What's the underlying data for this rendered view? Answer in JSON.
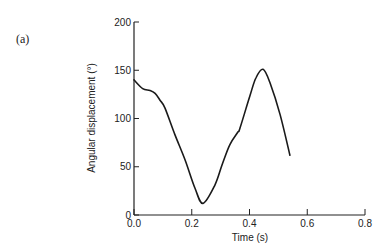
{
  "panel_label": "(a)",
  "chart_data": {
    "type": "line",
    "title": "",
    "xlabel": "Time (s)",
    "ylabel": "Angular displacement (°)",
    "xlim": [
      0.0,
      0.8
    ],
    "ylim": [
      0,
      200
    ],
    "x_ticks": [
      "0.0",
      "0.2",
      "0.4",
      "0.6",
      "0.8"
    ],
    "y_ticks": [
      "0",
      "50",
      "100",
      "150",
      "200"
    ],
    "grid": false,
    "legend": null,
    "series": [
      {
        "name": "Angular displacement",
        "color": "#1a1a1a",
        "x": [
          0.0,
          0.03,
          0.055,
          0.073,
          0.09,
          0.107,
          0.142,
          0.177,
          0.211,
          0.239,
          0.28,
          0.305,
          0.332,
          0.36,
          0.367,
          0.402,
          0.422,
          0.447,
          0.471,
          0.506,
          0.54
        ],
        "y": [
          140,
          131,
          129,
          126,
          119,
          111,
          83,
          57,
          28,
          12,
          31,
          52,
          73,
          86,
          90,
          124,
          142,
          151,
          137,
          104,
          62
        ]
      }
    ]
  }
}
